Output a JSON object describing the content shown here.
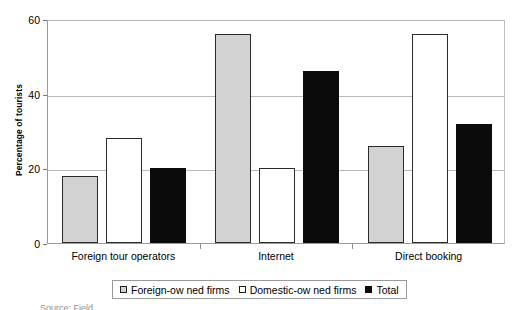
{
  "chart_data": {
    "type": "bar",
    "title": "",
    "xlabel": "",
    "ylabel": "Percentage of tourists",
    "ylim": [
      0,
      60
    ],
    "yticks": [
      0,
      20,
      40,
      60
    ],
    "grid": true,
    "legend_position": "bottom",
    "categories": [
      "Foreign tour operators",
      "Internet",
      "Direct booking"
    ],
    "series": [
      {
        "name": "Foreign-ow ned firms",
        "color": "#d2d2d2",
        "values": [
          18,
          56,
          26
        ]
      },
      {
        "name": "Domestic-ow ned firms",
        "color": "#ffffff",
        "values": [
          28,
          20,
          56
        ]
      },
      {
        "name": "Total",
        "color": "#0b0b0b",
        "values": [
          20,
          46,
          32
        ]
      }
    ]
  },
  "axis": {
    "y_title": "Percentage of tourists",
    "tick_labels": [
      "60",
      "40",
      "20",
      "0"
    ]
  },
  "legend": {
    "entries": [
      {
        "label": "Foreign-ow ned firms",
        "swatch": "light-gray-square"
      },
      {
        "label": "Domestic-ow ned firms",
        "swatch": "white-square"
      },
      {
        "label": "Total",
        "swatch": "black-square"
      }
    ]
  },
  "caption": {
    "clipped_text": "Source: Field"
  }
}
